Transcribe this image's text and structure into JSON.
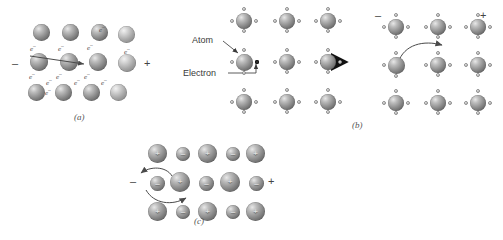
{
  "figure": {
    "background": "#ffffff",
    "caption_a": "(a)",
    "caption_b": "(b)",
    "caption_c": "(c)"
  },
  "signs": {
    "negative": "–",
    "positive": "+"
  },
  "panel_a": {
    "name": "metallic-bonding-electron-sea",
    "electron_label": "e",
    "electron_charge": "–",
    "sign_left": "–",
    "sign_right": "+",
    "sphere_rows": 3,
    "sphere_cols": 4,
    "electron_labels": [
      {
        "x": 22,
        "y": 52
      },
      {
        "x": 52,
        "y": 52
      },
      {
        "x": 82,
        "y": 48
      },
      {
        "x": 94,
        "y": 30
      },
      {
        "x": 22,
        "y": 80
      },
      {
        "x": 52,
        "y": 80
      },
      {
        "x": 82,
        "y": 78
      },
      {
        "x": 110,
        "y": 62
      },
      {
        "x": 24,
        "y": 92
      },
      {
        "x": 38,
        "y": 88
      },
      {
        "x": 62,
        "y": 88
      },
      {
        "x": 88,
        "y": 88
      }
    ],
    "drift_arrow": {
      "x1": 26,
      "y1": 58,
      "x2": 86,
      "y2": 66
    }
  },
  "panel_b": {
    "name": "covalent-lattice-electron-hop",
    "label_atom": "Atom",
    "label_electron": "Electron",
    "sign_left": "–",
    "sign_right": "+",
    "grid_rows": 3,
    "grid_cols": 3,
    "transition_arrow": true
  },
  "panel_c": {
    "name": "ionic-lattice-ion-migration",
    "sign_left": "–",
    "sign_right": "+",
    "cation_symbol": "+",
    "anion_symbol": "–",
    "rows": 3,
    "cols": 5,
    "pattern": [
      [
        "+",
        "-",
        "+",
        "-",
        "+"
      ],
      [
        "-",
        "+",
        "-",
        "+",
        "-"
      ],
      [
        "+",
        "-",
        "+",
        "-",
        "+"
      ]
    ]
  }
}
